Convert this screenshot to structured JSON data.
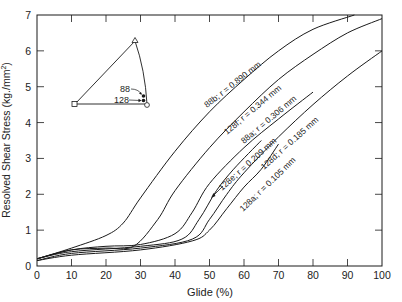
{
  "chart_data": {
    "type": "line",
    "title": "",
    "xlabel": "Glide (%)",
    "ylabel": "Resolved Shear Stress (kg./mm²)",
    "xlim": [
      0,
      100
    ],
    "ylim": [
      0,
      7
    ],
    "xticks": [
      0,
      10,
      20,
      30,
      40,
      50,
      60,
      70,
      80,
      90,
      100
    ],
    "yticks": [
      0,
      1,
      2,
      3,
      4,
      5,
      6,
      7
    ],
    "grid": false,
    "legend": "inline labels along curves",
    "series": [
      {
        "name": "88b; r = 0.890 mm",
        "id": "88b",
        "r_mm": 0.89,
        "x": [
          0,
          10,
          20,
          25,
          30,
          40,
          50,
          60,
          70,
          80,
          92
        ],
        "y": [
          0.2,
          0.5,
          0.85,
          1.2,
          1.9,
          3.2,
          4.3,
          5.2,
          6.0,
          6.6,
          7.0
        ]
      },
      {
        "name": "128f; r = 0.344 mm",
        "id": "128f",
        "r_mm": 0.344,
        "x": [
          0,
          10,
          20,
          28,
          35,
          40,
          50,
          60,
          70,
          80,
          90,
          100
        ],
        "y": [
          0.2,
          0.45,
          0.5,
          0.55,
          1.3,
          2.1,
          3.3,
          4.3,
          5.2,
          5.9,
          6.5,
          6.9
        ]
      },
      {
        "name": "88a; r = 0.306 mm",
        "id": "88a",
        "r_mm": 0.306,
        "x": [
          0,
          10,
          20,
          30,
          40,
          45,
          50,
          60,
          70,
          80
        ],
        "y": [
          0.2,
          0.45,
          0.55,
          0.6,
          0.9,
          1.5,
          2.3,
          3.3,
          4.1,
          4.85
        ]
      },
      {
        "name": "128e; r = 0.209 mm",
        "id": "128e",
        "r_mm": 0.209,
        "x": [
          0,
          10,
          30,
          42,
          47,
          52,
          57,
          65
        ],
        "y": [
          0.2,
          0.4,
          0.55,
          0.75,
          1.3,
          2.1,
          2.7,
          3.5
        ]
      },
      {
        "name": "128d; r = 0.185 mm",
        "id": "128d",
        "r_mm": 0.185,
        "x": [
          0,
          10,
          30,
          45,
          50,
          55,
          60,
          70,
          80,
          90,
          100
        ],
        "y": [
          0.15,
          0.35,
          0.5,
          0.75,
          1.3,
          2.0,
          2.6,
          3.6,
          4.5,
          5.3,
          6.0
        ]
      },
      {
        "name": "128a; r = 0.105 mm",
        "id": "128a",
        "r_mm": 0.105,
        "x": [
          0,
          10,
          30,
          45,
          50,
          55,
          60,
          65,
          70
        ],
        "y": [
          0.15,
          0.3,
          0.45,
          0.7,
          1.0,
          1.6,
          2.2,
          2.7,
          3.4
        ]
      }
    ],
    "inset": {
      "type": "stereographic triangle",
      "markers": [
        "square",
        "triangle",
        "circle"
      ],
      "annotations": [
        "88",
        "128"
      ]
    }
  },
  "labels": {
    "xlabel": "Glide (%)",
    "ylabel": "Resolved Shear Stress (kg./mm",
    "ylabel_sup": "2",
    "ylabel_end": ")",
    "inset_88": "88",
    "inset_128": "128",
    "curve_88b": "88b; r = 0.890 mm",
    "curve_128f": "128f; r = 0.344 mm",
    "curve_88a": "88a; r = 0.306 mm",
    "curve_128e": "128e; r = 0.209 mm",
    "curve_128d": "128d; r = 0.185 mm",
    "curve_128a": "128a; r = 0.105 mm"
  },
  "style": {
    "line_color": "#1a1a1a",
    "axis_color": "#1a1a1a",
    "background": "#ffffff"
  }
}
